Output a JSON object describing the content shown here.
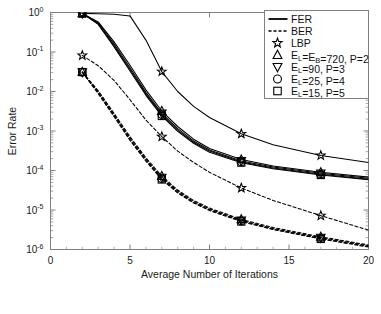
{
  "axes": {
    "xlabel": "Average Number of Iterations",
    "ylabel": "Error Rate",
    "xticks": [
      "0",
      "5",
      "10",
      "15",
      "20"
    ],
    "xtick_values": [
      0,
      5,
      10,
      15,
      20
    ],
    "yticks": [
      "10^0",
      "10^-1",
      "10^-2",
      "10^-3",
      "10^-4",
      "10^-5",
      "10^-6"
    ],
    "ytick_exponents": [
      "0",
      "-1",
      "-2",
      "-3",
      "-4",
      "-5",
      "-6"
    ],
    "ytick_base": "10",
    "xlim": [
      0,
      20
    ],
    "ylim": [
      1e-06,
      1
    ]
  },
  "legend": {
    "entries": [
      {
        "label": "FER",
        "style": "solid-line",
        "marker": "none"
      },
      {
        "label": "BER",
        "style": "dashed-line",
        "marker": "none"
      },
      {
        "label": "LBP",
        "style": "marker-only",
        "marker": "star"
      },
      {
        "label": "E_L=E_B=720, P=2",
        "style": "marker-only",
        "marker": "triangle-up"
      },
      {
        "label": "E_L=90, P=3",
        "style": "marker-only",
        "marker": "triangle-down"
      },
      {
        "label": "E_L=25, P=4",
        "style": "marker-only",
        "marker": "circle"
      },
      {
        "label": "E_L=15, P=5",
        "style": "marker-only",
        "marker": "square"
      }
    ]
  },
  "chart_data": {
    "type": "line",
    "title": "",
    "xlabel": "Average Number of Iterations",
    "ylabel": "Error Rate",
    "xlim": [
      0,
      20
    ],
    "ylim": [
      1e-06,
      1
    ],
    "yscale": "log",
    "grid": false,
    "legend_position": "top-right",
    "marker_x": [
      2,
      7,
      12,
      17
    ],
    "series": [
      {
        "name": "LBP FER",
        "metric": "FER",
        "linestyle": "solid",
        "marker": "star",
        "x": [
          2,
          3,
          4,
          5,
          6,
          7,
          8,
          9,
          10,
          12,
          14,
          17,
          20
        ],
        "y": [
          0.95,
          0.93,
          0.9,
          0.82,
          0.2,
          0.032,
          0.01,
          0.0042,
          0.0022,
          0.00085,
          0.00045,
          0.00024,
          0.00016
        ]
      },
      {
        "name": "E_L=E_B=720, P=2 FER",
        "metric": "FER",
        "linestyle": "solid",
        "marker": "triangle-up",
        "x": [
          2,
          3,
          4,
          5,
          6,
          7,
          8,
          9,
          10,
          12,
          14,
          17,
          20
        ],
        "y": [
          0.95,
          0.58,
          0.18,
          0.046,
          0.011,
          0.0032,
          0.0013,
          0.00062,
          0.00036,
          0.00019,
          0.00013,
          9e-05,
          6.8e-05
        ]
      },
      {
        "name": "E_L=90, P=3 FER",
        "metric": "FER",
        "linestyle": "solid",
        "marker": "triangle-down",
        "x": [
          2,
          3,
          4,
          5,
          6,
          7,
          8,
          9,
          10,
          12,
          14,
          17,
          20
        ],
        "y": [
          0.95,
          0.55,
          0.16,
          0.04,
          0.0095,
          0.0028,
          0.00115,
          0.00056,
          0.00033,
          0.000175,
          0.000122,
          8.5e-05,
          6.4e-05
        ]
      },
      {
        "name": "E_L=25, P=4 FER",
        "metric": "FER",
        "linestyle": "solid",
        "marker": "circle",
        "x": [
          2,
          3,
          4,
          5,
          6,
          7,
          8,
          9,
          10,
          12,
          14,
          17,
          20
        ],
        "y": [
          0.95,
          0.52,
          0.145,
          0.036,
          0.0086,
          0.0026,
          0.00105,
          0.00052,
          0.00031,
          0.000165,
          0.000116,
          8e-05,
          6e-05
        ]
      },
      {
        "name": "E_L=15, P=5 FER",
        "metric": "FER",
        "linestyle": "solid",
        "marker": "square",
        "x": [
          2,
          3,
          4,
          5,
          6,
          7,
          8,
          9,
          10,
          12,
          14,
          17,
          20
        ],
        "y": [
          0.95,
          0.5,
          0.135,
          0.033,
          0.008,
          0.0024,
          0.00098,
          0.00049,
          0.00029,
          0.000158,
          0.000111,
          7.7e-05,
          5.8e-05
        ]
      },
      {
        "name": "LBP BER",
        "metric": "BER",
        "linestyle": "dashed",
        "marker": "star",
        "x": [
          2,
          3,
          4,
          5,
          6,
          7,
          8,
          9,
          10,
          12,
          14,
          17,
          20
        ],
        "y": [
          0.082,
          0.045,
          0.019,
          0.0062,
          0.0019,
          0.00072,
          0.00031,
          0.00016,
          9e-05,
          3.6e-05,
          1.75e-05,
          7.2e-06,
          3.1e-06
        ]
      },
      {
        "name": "E_L=E_B=720, P=2 BER",
        "metric": "BER",
        "linestyle": "dashed",
        "marker": "triangle-up",
        "x": [
          2,
          3,
          4,
          5,
          6,
          7,
          8,
          9,
          10,
          12,
          14,
          17,
          20
        ],
        "y": [
          0.031,
          0.0105,
          0.0028,
          0.00072,
          0.00021,
          7.2e-05,
          3.2e-05,
          1.75e-05,
          1.12e-05,
          5.8e-06,
          3.6e-06,
          2.1e-06,
          1.3e-06
        ]
      },
      {
        "name": "E_L=90, P=3 BER",
        "metric": "BER",
        "linestyle": "dashed",
        "marker": "triangle-down",
        "x": [
          2,
          3,
          4,
          5,
          6,
          7,
          8,
          9,
          10,
          12,
          14,
          17,
          20
        ],
        "y": [
          0.031,
          0.0098,
          0.0026,
          0.00066,
          0.000195,
          6.65e-05,
          2.99e-05,
          1.65e-05,
          1.06e-05,
          5.5e-06,
          3.4e-06,
          2e-06,
          1.25e-06
        ]
      },
      {
        "name": "E_L=25, P=4 BER",
        "metric": "BER",
        "linestyle": "dashed",
        "marker": "circle",
        "x": [
          2,
          3,
          4,
          5,
          6,
          7,
          8,
          9,
          10,
          12,
          14,
          17,
          20
        ],
        "y": [
          0.031,
          0.0092,
          0.0024,
          0.00061,
          0.000181,
          6.21e-05,
          2.81e-05,
          1.56e-05,
          1.01e-05,
          5.3e-06,
          3.3e-06,
          1.9e-06,
          1.2e-06
        ]
      },
      {
        "name": "E_L=15, P=5 BER",
        "metric": "BER",
        "linestyle": "dashed",
        "marker": "square",
        "x": [
          2,
          3,
          4,
          5,
          6,
          7,
          8,
          9,
          10,
          12,
          14,
          17,
          20
        ],
        "y": [
          0.031,
          0.0088,
          0.0023,
          0.00058,
          0.000172,
          5.92e-05,
          2.69e-05,
          1.5e-05,
          9.7e-06,
          5.1e-06,
          3.2e-06,
          1.85e-06,
          1.15e-06
        ]
      }
    ]
  },
  "colors": {
    "line": "#000000",
    "axis": "#808080",
    "text": "#1a1a1a",
    "background": "#ffffff"
  }
}
